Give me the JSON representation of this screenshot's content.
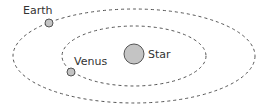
{
  "diagram": {
    "type": "orbital-system",
    "colors": {
      "background": "#ffffff",
      "orbit_stroke": "#555555",
      "body_fill": "#c4c4c4",
      "body_stroke": "#555555",
      "label": "#333333"
    },
    "star": {
      "label": "Star"
    },
    "planets": [
      {
        "label": "Earth",
        "orbit": "outer"
      },
      {
        "label": "Venus",
        "orbit": "inner"
      }
    ],
    "orbits": [
      {
        "name": "outer",
        "style": "dashed"
      },
      {
        "name": "inner",
        "style": "dashed"
      }
    ]
  }
}
